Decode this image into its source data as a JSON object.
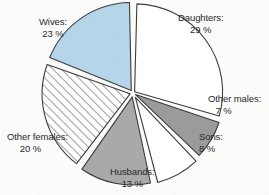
{
  "chart_data": {
    "type": "pie",
    "title": "",
    "subtitle": "",
    "xlabel": "",
    "ylabel": "",
    "grid": false,
    "legend_position": "outside-labels",
    "exploded": true,
    "start_angle_deg": 0,
    "direction": "clockwise",
    "center": {
      "x": 133,
      "y": 93
    },
    "radius": 88,
    "categories": [
      "Daughters",
      "Other males",
      "Sons",
      "Husbands",
      "Other females",
      "Wives"
    ],
    "values": [
      29,
      7,
      8,
      13,
      20,
      23
    ],
    "unit": "%",
    "slices": [
      {
        "label": "Daughters:",
        "value": 29,
        "value_text": "29 %",
        "fill": "#ffffff",
        "pattern": "solid",
        "stroke": "#3c3c3c",
        "start_deg": 1.5,
        "end_deg": 105.9,
        "explode": 2.0,
        "label_x": 178,
        "label_y": 12
      },
      {
        "label": "Other males:",
        "value": 7,
        "value_text": "7 %",
        "fill": "#9b9b9b",
        "pattern": "solid",
        "stroke": "#3c3c3c",
        "start_deg": 108.5,
        "end_deg": 133.7,
        "explode": 3.0,
        "label_x": 208,
        "label_y": 93
      },
      {
        "label": "Sons:",
        "value": 8,
        "value_text": "8 %",
        "fill": "#ffffff",
        "pattern": "solid",
        "stroke": "#3c3c3c",
        "start_deg": 136.5,
        "end_deg": 165.3,
        "explode": 5.0,
        "label_x": 199,
        "label_y": 131
      },
      {
        "label": "Husbands:",
        "value": 13,
        "value_text": "13 %",
        "fill": "#a9a9a9",
        "pattern": "solid",
        "stroke": "#3c3c3c",
        "start_deg": 168.0,
        "end_deg": 214.8,
        "explode": 4.0,
        "label_x": 110,
        "label_y": 166
      },
      {
        "label": "Other females:",
        "value": 20,
        "value_text": "20 %",
        "fill": "#ffffff",
        "pattern": "diagonal-hatch",
        "stroke": "#3c3c3c",
        "start_deg": 217.5,
        "end_deg": 289.5,
        "explode": 3.0,
        "label_x": 7,
        "label_y": 131
      },
      {
        "label": "Wives:",
        "value": 23,
        "value_text": "23 %",
        "fill": "#b4d6e8",
        "pattern": "solid",
        "stroke": "#3c3c3c",
        "start_deg": 292.0,
        "end_deg": 358.8,
        "explode": 3.0,
        "label_x": 39,
        "label_y": 16
      }
    ],
    "colors": {
      "wives": "#b4d6e8",
      "husbands": "#a9a9a9",
      "other_males": "#9b9b9b",
      "white_slice": "#ffffff",
      "outline": "#3c3c3c",
      "hatch_line": "#555555",
      "label_text": "#2a2a2a",
      "page_background": "#fbfbf9"
    }
  },
  "labels": {
    "daughters": {
      "name": "Daughters:",
      "pct": "29 %"
    },
    "other_males": {
      "name": "Other males:",
      "pct": "7 %"
    },
    "sons": {
      "name": "Sons:",
      "pct": "8 %"
    },
    "husbands": {
      "name": "Husbands:",
      "pct": "13 %"
    },
    "other_females": {
      "name": "Other females:",
      "pct": "20 %"
    },
    "wives": {
      "name": "Wives:",
      "pct": "23 %"
    }
  }
}
